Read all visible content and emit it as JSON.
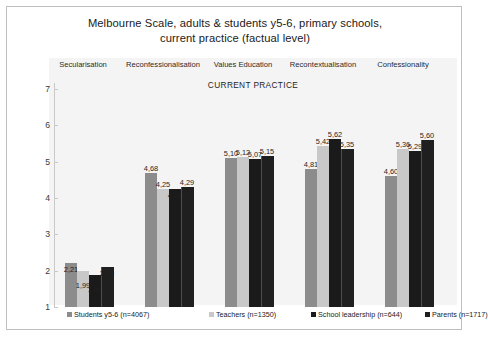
{
  "title_line1": "Melbourne Scale, adults & students y5-6, primary schools,",
  "title_line2": "current practice (factual level)",
  "subtitle": "CURRENT PRACTICE",
  "colors": {
    "students": "#8c8c8c",
    "teachers": "#c8c8c8",
    "leadership": "#1a1a1a",
    "parents": "#1f1f1f",
    "panel_bg": "#f4f4f4",
    "card_border": "#bfbfbf",
    "axis": "#c9c9c9"
  },
  "chart_data": {
    "type": "bar",
    "title": "Melbourne Scale, adults & students y5-6, primary schools, current practice (factual level)",
    "subtitle": "CURRENT PRACTICE",
    "xlabel": "",
    "ylabel": "",
    "ylim": [
      1,
      7
    ],
    "yticks": [
      7,
      6,
      5,
      4,
      3,
      2,
      1
    ],
    "grid": false,
    "legend_position": "bottom",
    "categories": [
      "Secularisation",
      "Reconfessionalisation",
      "Values Education",
      "Recontextualisation",
      "Confessionality"
    ],
    "series": [
      {
        "name": "Students y5-6 (n=4067)",
        "values": [
          2.21,
          4.68,
          5.1,
          4.81,
          4.6
        ],
        "labels": [
          "2,21",
          "4,68",
          "5,10",
          "4,81",
          "4,60"
        ]
      },
      {
        "name": "Teachers (n=1350)",
        "values": [
          1.99,
          4.25,
          5.12,
          5.42,
          5.36
        ],
        "labels": [
          "1,99",
          "4,25",
          "5,12",
          "5,42",
          "5,36"
        ]
      },
      {
        "name": "School leadership  (n=644)",
        "values": [
          1.88,
          4.24,
          5.07,
          5.62,
          5.29
        ],
        "labels": [
          "1,88",
          "4,24",
          "5,07",
          "5,62",
          "5,29"
        ]
      },
      {
        "name": "Parents (n=1717)",
        "values": [
          2.1,
          4.29,
          5.15,
          5.35,
          5.6
        ],
        "labels": [
          "2,10",
          "4,29",
          "5,15",
          "5,35",
          "5,60"
        ]
      }
    ]
  }
}
